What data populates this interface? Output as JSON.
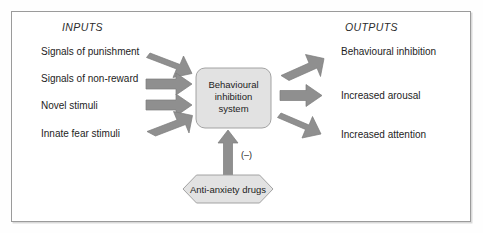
{
  "figure": {
    "headers": {
      "inputs": "INPUTS",
      "outputs": "OUTPUTS"
    },
    "inputs": [
      {
        "label": "Signals of punishment"
      },
      {
        "label": "Signals of non-reward"
      },
      {
        "label": "Novel stimuli"
      },
      {
        "label": "Innate fear stimuli"
      }
    ],
    "outputs": [
      {
        "label": "Behavioural  inhibition"
      },
      {
        "label": "Increased arousal"
      },
      {
        "label": "Increased attention"
      }
    ],
    "central_node": {
      "line1": "Behavioural",
      "line2": "inhibition",
      "line3": "system"
    },
    "modulator": {
      "label": "Anti-anxiety drugs",
      "sign": "(–)"
    },
    "colors": {
      "arrow_fill": "#8f8f8f",
      "arrow_stroke": "#7c7c7c",
      "node_fill": "#e2e2e2",
      "node_stroke": "#9a9a9a",
      "hex_fill": "#e2e2e2",
      "hex_stroke": "#9a9a9a",
      "frame_stroke": "#9b9b9b",
      "text": "#1d1d1d",
      "background": "#ffffff"
    }
  }
}
